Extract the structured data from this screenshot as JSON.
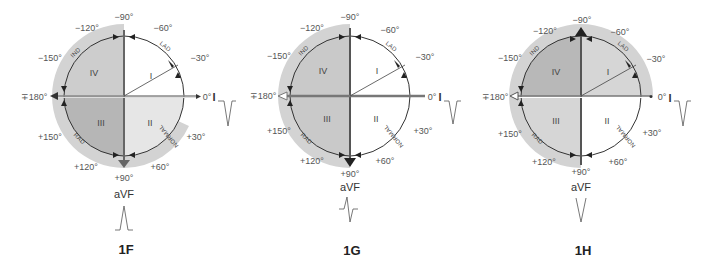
{
  "figures": [
    {
      "id": "1F",
      "label": "1F",
      "lead_bottom": "aVF",
      "lead_right": "I",
      "lead_I_waveform": "negative",
      "lead_aVF_waveform": "positive",
      "angles": {
        "n90": "−90°",
        "n60": "−60°",
        "n30": "−30°",
        "zero": "0°",
        "p30": "+30°",
        "p60": "+60°",
        "p90": "+90°",
        "p120": "+120°",
        "p150": "+150°",
        "pm180": "∓180°",
        "n150": "−150°",
        "n120": "−120°"
      },
      "quadrants": {
        "q1": "I",
        "q2": "II",
        "q3": "III",
        "q4": "IV"
      },
      "arcs": {
        "ind": "IND",
        "lad": "LAD",
        "normal": "NORMAL",
        "rad": "RAD"
      }
    },
    {
      "id": "1G",
      "label": "1G",
      "lead_bottom": "aVF",
      "lead_right": "I",
      "lead_I_waveform": "negative",
      "lead_aVF_waveform": "biphasic",
      "angles": {
        "n90": "−90°",
        "n60": "−60°",
        "n30": "−30°",
        "zero": "0°",
        "p30": "+30°",
        "p60": "+60°",
        "p90": "+90°",
        "p120": "+120°",
        "p150": "+150°",
        "pm180": "∓180°",
        "n150": "−150°",
        "n120": "−120°"
      },
      "quadrants": {
        "q1": "I",
        "q2": "II",
        "q3": "III",
        "q4": "IV"
      },
      "arcs": {
        "ind": "IND",
        "lad": "LAD",
        "normal": "NORMAL",
        "rad": "RAD"
      }
    },
    {
      "id": "1H",
      "label": "1H",
      "lead_bottom": "aVF",
      "lead_right": "I",
      "lead_I_waveform": "negative",
      "lead_aVF_waveform": "negative",
      "angles": {
        "n90": "−90°",
        "n60": "−60°",
        "n30": "−30°",
        "zero": "0°",
        "p30": "+30°",
        "p60": "+60°",
        "p90": "+90°",
        "p120": "+120°",
        "p150": "+150°",
        "pm180": "∓180°",
        "n150": "−150°",
        "n120": "−120°"
      },
      "quadrants": {
        "q1": "I",
        "q2": "II",
        "q3": "III",
        "q4": "IV"
      },
      "arcs": {
        "ind": "IND",
        "lad": "LAD",
        "normal": "NORMAL",
        "rad": "RAD"
      }
    }
  ],
  "colors": {
    "white": "#ffffff",
    "light": "#e4e4e4",
    "medium": "#cfcfcf",
    "dark": "#b4b4b4",
    "axis": "#666666",
    "arrow": "#333333"
  }
}
